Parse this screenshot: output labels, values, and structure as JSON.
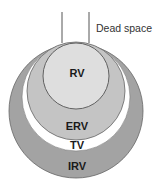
{
  "diagram": {
    "dead_space_label": "Dead space",
    "regions": [
      {
        "id": "irv",
        "label": "IRV",
        "color": "#a3a3a3"
      },
      {
        "id": "tv",
        "label": "TV",
        "color": "#ffffff"
      },
      {
        "id": "erv",
        "label": "ERV",
        "color": "#c4c4c4"
      },
      {
        "id": "rv",
        "label": "RV",
        "color": "#dedede"
      }
    ],
    "stroke_color": "#555555"
  }
}
